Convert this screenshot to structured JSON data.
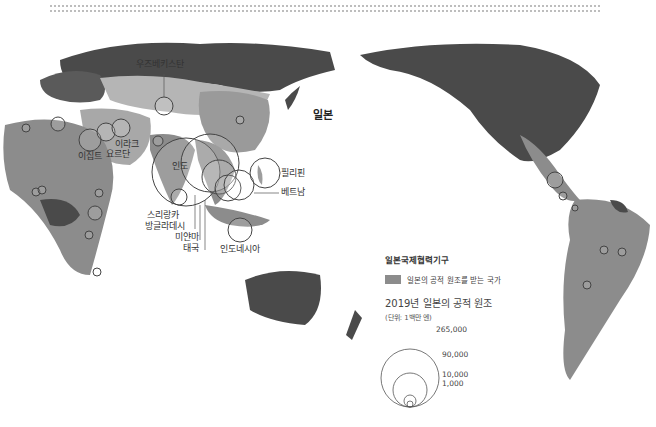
{
  "map": {
    "title_bold": "일본",
    "country_labels": [
      {
        "name": "우즈베키스탄",
        "x": 136,
        "y": 64
      },
      {
        "name": "이라크",
        "x": 115,
        "y": 143
      },
      {
        "name": "요르단",
        "x": 108,
        "y": 153
      },
      {
        "name": "이집트",
        "x": 78,
        "y": 155
      },
      {
        "name": "인도",
        "x": 170,
        "y": 165
      },
      {
        "name": "필리핀",
        "x": 281,
        "y": 171
      },
      {
        "name": "베트남",
        "x": 281,
        "y": 190
      },
      {
        "name": "스리랑카",
        "x": 147,
        "y": 213
      },
      {
        "name": "방글라데시",
        "x": 148,
        "y": 224
      },
      {
        "name": "미얀마",
        "x": 176,
        "y": 235
      },
      {
        "name": "태국",
        "x": 185,
        "y": 246
      },
      {
        "name": "인도네시아",
        "x": 221,
        "y": 247
      }
    ],
    "japan_label": {
      "name": "일본",
      "x": 314,
      "y": 113
    }
  },
  "legend": {
    "title": "일본국제협력기구",
    "swatch_label": "일본의 공적 원조를 받는 국가",
    "swatch_color": "#8c8c8c",
    "size_title": "2019년 일본의 공적 원조",
    "size_unit": "(단위: 1백만 엔)",
    "size_values": [
      "265,000",
      "90,000",
      "10,000",
      "1,000"
    ]
  },
  "colors": {
    "land_dark": "#4a4a4a",
    "land_mid": "#8c8c8c",
    "land_light": "#bdbdbd",
    "ocean": "#ffffff",
    "circle_stroke": "#444444"
  }
}
